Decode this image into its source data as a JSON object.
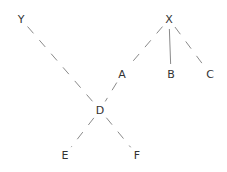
{
  "diagram": {
    "type": "tree",
    "nodes": [
      {
        "id": "X",
        "label": "X"
      },
      {
        "id": "Y",
        "label": "Y"
      },
      {
        "id": "A",
        "label": "A"
      },
      {
        "id": "B",
        "label": "B"
      },
      {
        "id": "C",
        "label": "C"
      },
      {
        "id": "D",
        "label": "D"
      },
      {
        "id": "E",
        "label": "E"
      },
      {
        "id": "F",
        "label": "F"
      }
    ],
    "edges": [
      {
        "from": "X",
        "to": "A",
        "style": "dashed"
      },
      {
        "from": "X",
        "to": "B",
        "style": "solid"
      },
      {
        "from": "X",
        "to": "C",
        "style": "dashed"
      },
      {
        "from": "Y",
        "to": "D",
        "style": "dashed"
      },
      {
        "from": "A",
        "to": "D",
        "style": "dashed"
      },
      {
        "from": "D",
        "to": "E",
        "style": "dashed"
      },
      {
        "from": "D",
        "to": "F",
        "style": "dashed"
      }
    ]
  }
}
